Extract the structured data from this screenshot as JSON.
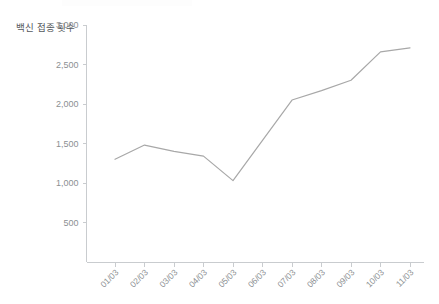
{
  "chart_data": {
    "type": "line",
    "title": "",
    "xlabel": "",
    "ylabel": "백신 접종 횟수",
    "categories": [
      "01/03",
      "02/03",
      "03/03",
      "04/03",
      "05/03",
      "06/03",
      "07/03",
      "08/03",
      "09/03",
      "10/03",
      "11/03"
    ],
    "values": [
      1300,
      1480,
      1400,
      1340,
      1030,
      1540,
      2050,
      2170,
      2300,
      2660,
      2710
    ],
    "series": [
      {
        "name": "백신 접종 횟수",
        "values": [
          1300,
          1480,
          1400,
          1340,
          1030,
          1540,
          2050,
          2170,
          2300,
          2660,
          2710
        ],
        "color": "#a8a8a8"
      }
    ],
    "ylim": [
      0,
      3000
    ],
    "ytick_values": [
      500,
      1000,
      1500,
      2000,
      2500,
      3000
    ],
    "ytick_labels": [
      "500",
      "1,000",
      "1,500",
      "2,000",
      "2,500",
      "3,000"
    ],
    "grid": false,
    "legend": "none",
    "xtick_rotation": -45
  },
  "axis": {
    "y_title": "백신 접종 횟수",
    "line_color": "#c9cccf",
    "label_color": "#8b8f92",
    "title_color": "#55595c"
  }
}
